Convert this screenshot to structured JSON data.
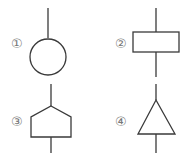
{
  "figures": [
    {
      "label": "①",
      "shape": "circle"
    },
    {
      "label": "②",
      "shape": "rectangle"
    },
    {
      "label": "③",
      "shape": "pentagon"
    },
    {
      "label": "④",
      "shape": "triangle"
    }
  ],
  "colors": {
    "stroke": "#3a3a3a",
    "label": "#777777",
    "background": "#ffffff"
  }
}
